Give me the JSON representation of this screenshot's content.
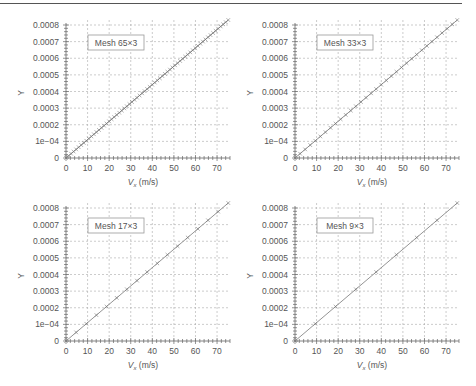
{
  "figure": {
    "x_axis_label_main": "V",
    "x_axis_label_sub": "x",
    "x_axis_label_unit": " (m/s)",
    "y_axis_label": "Y"
  },
  "chart_data": [
    {
      "type": "line",
      "title": "Mesh 65×3",
      "legend": "Mesh 65×3",
      "xlabel": "Vx (m/s)",
      "ylabel": "Y",
      "xlim": [
        0,
        76
      ],
      "ylim": [
        0,
        0.00083
      ],
      "xticks": [
        "0",
        "10",
        "20",
        "30",
        "40",
        "50",
        "60",
        "70"
      ],
      "yticks": [
        "0",
        "1e−04",
        "0.0002",
        "0.0003",
        "0.0004",
        "0.0005",
        "0.0006",
        "0.0007",
        "0.0008"
      ],
      "grid": true,
      "n_points": 65,
      "slope": 1.1e-05,
      "series": [
        {
          "name": "Mesh 65×3",
          "x_start": 0,
          "x_end": 75.2,
          "y_start": 0,
          "y_end": 0.00083
        }
      ]
    },
    {
      "type": "line",
      "title": "Mesh 33×3",
      "legend": "Mesh 33×3",
      "xlabel": "Vx (m/s)",
      "ylabel": "Y",
      "xlim": [
        0,
        76
      ],
      "ylim": [
        0,
        0.00083
      ],
      "xticks": [
        "0",
        "10",
        "20",
        "30",
        "40",
        "50",
        "60",
        "70"
      ],
      "yticks": [
        "0",
        "1e−04",
        "0.0002",
        "0.0003",
        "0.0004",
        "0.0005",
        "0.0006",
        "0.0007",
        "0.0008"
      ],
      "grid": true,
      "n_points": 33,
      "slope": 1.1e-05,
      "series": [
        {
          "name": "Mesh 33×3",
          "x_start": 0,
          "x_end": 75.2,
          "y_start": 0,
          "y_end": 0.00083
        }
      ]
    },
    {
      "type": "line",
      "title": "Mesh 17×3",
      "legend": "Mesh 17×3",
      "xlabel": "Vx (m/s)",
      "ylabel": "Y",
      "xlim": [
        0,
        76
      ],
      "ylim": [
        0,
        0.00083
      ],
      "xticks": [
        "0",
        "10",
        "20",
        "30",
        "40",
        "50",
        "60",
        "70"
      ],
      "yticks": [
        "0",
        "1e−04",
        "0.0002",
        "0.0003",
        "0.0004",
        "0.0005",
        "0.0006",
        "0.0007",
        "0.0008"
      ],
      "grid": true,
      "n_points": 17,
      "slope": 1.1e-05,
      "series": [
        {
          "name": "Mesh 17×3",
          "x_start": 0,
          "x_end": 75.2,
          "y_start": 0,
          "y_end": 0.00083
        }
      ]
    },
    {
      "type": "line",
      "title": "Mesh 9×3",
      "legend": "Mesh 9×3",
      "xlabel": "Vx (m/s)",
      "ylabel": "Y",
      "xlim": [
        0,
        76
      ],
      "ylim": [
        0,
        0.00083
      ],
      "xticks": [
        "0",
        "10",
        "20",
        "30",
        "40",
        "50",
        "60",
        "70"
      ],
      "yticks": [
        "0",
        "1e−04",
        "0.0002",
        "0.0003",
        "0.0004",
        "0.0005",
        "0.0006",
        "0.0007",
        "0.0008"
      ],
      "grid": true,
      "n_points": 9,
      "slope": 1.1e-05,
      "x": [
        0,
        9.4,
        18.8,
        28.2,
        37.6,
        47.0,
        56.4,
        65.8,
        75.2
      ],
      "values": [
        0,
        0.000103,
        0.000207,
        0.00031,
        0.000414,
        0.000517,
        0.00062,
        0.000724,
        0.000827
      ],
      "series": [
        {
          "name": "Mesh 9×3",
          "x_start": 0,
          "x_end": 75.2,
          "y_start": 0,
          "y_end": 0.00083
        }
      ]
    }
  ],
  "colors": {
    "line": "#888888",
    "marker": "#777777",
    "grid": "#aaaaaa",
    "axis": "#666666",
    "text": "#555555"
  }
}
